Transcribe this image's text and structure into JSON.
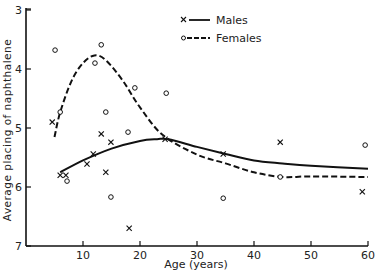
{
  "chart_data": {
    "type": "scatter",
    "title": "",
    "xlabel": "Age (years)",
    "ylabel": "Average placing of naphthalene",
    "xlim": [
      0,
      60
    ],
    "ylim": [
      3,
      7
    ],
    "y_inverted": true,
    "x_ticks": [
      10,
      20,
      30,
      40,
      50,
      60
    ],
    "y_ticks": [
      3,
      4,
      5,
      6,
      7
    ],
    "grid": false,
    "legend": {
      "position": "top-center",
      "entries": [
        "Males",
        "Females"
      ]
    },
    "series": [
      {
        "name": "Males",
        "marker": "x",
        "line": "solid",
        "points": [
          [
            4.6,
            4.9
          ],
          [
            6.0,
            5.8
          ],
          [
            7.0,
            5.8
          ],
          [
            10.7,
            5.61
          ],
          [
            11.8,
            5.44
          ],
          [
            13.2,
            5.1
          ],
          [
            14.0,
            5.75
          ],
          [
            14.9,
            5.24
          ],
          [
            18.1,
            6.7
          ],
          [
            24.4,
            5.19
          ],
          [
            34.6,
            5.44
          ],
          [
            44.6,
            5.24
          ],
          [
            59.0,
            6.08
          ]
        ],
        "curve": [
          [
            6,
            5.75
          ],
          [
            10,
            5.55
          ],
          [
            15,
            5.35
          ],
          [
            20,
            5.22
          ],
          [
            23,
            5.19
          ],
          [
            25,
            5.19
          ],
          [
            30,
            5.32
          ],
          [
            35,
            5.44
          ],
          [
            40,
            5.55
          ],
          [
            45,
            5.6
          ],
          [
            50,
            5.64
          ],
          [
            60,
            5.69
          ]
        ]
      },
      {
        "name": "Females",
        "marker": "o",
        "line": "dashed",
        "points": [
          [
            5.1,
            3.68
          ],
          [
            6.0,
            4.73
          ],
          [
            7.2,
            5.9
          ],
          [
            12.1,
            3.9
          ],
          [
            13.2,
            3.59
          ],
          [
            14.0,
            4.73
          ],
          [
            14.9,
            6.17
          ],
          [
            17.9,
            5.07
          ],
          [
            19.1,
            4.32
          ],
          [
            24.6,
            4.41
          ],
          [
            34.6,
            6.19
          ],
          [
            44.6,
            5.83
          ],
          [
            59.5,
            5.29
          ]
        ],
        "curve": [
          [
            5,
            5.15
          ],
          [
            6,
            4.73
          ],
          [
            8,
            4.2
          ],
          [
            10,
            3.9
          ],
          [
            12,
            3.77
          ],
          [
            14,
            3.85
          ],
          [
            17,
            4.2
          ],
          [
            20,
            4.65
          ],
          [
            24,
            5.12
          ],
          [
            30,
            5.45
          ],
          [
            35,
            5.6
          ],
          [
            40,
            5.75
          ],
          [
            45,
            5.83
          ],
          [
            50,
            5.82
          ],
          [
            60,
            5.83
          ]
        ]
      }
    ]
  },
  "axes": {
    "xlabel": "Age (years)",
    "ylabel": "Average placing of naphthalene",
    "x_tick_labels": [
      "10",
      "20",
      "30",
      "40",
      "50",
      "60"
    ],
    "y_tick_labels": [
      "3",
      "4",
      "5",
      "6",
      "7"
    ]
  },
  "legend": {
    "males_label": "Males",
    "females_label": "Females"
  }
}
